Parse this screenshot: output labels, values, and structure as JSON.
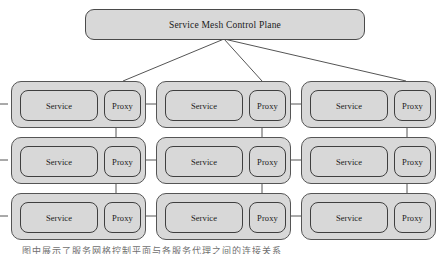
{
  "diagram": {
    "title": "Service Mesh Control Plane",
    "control_plane": {
      "label": "Service Mesh Control Plane"
    },
    "labels": {
      "service": "Service",
      "proxy": "Proxy"
    },
    "colors": {
      "box_fill": "#d8d8d8",
      "box_border": "#4a4a4a",
      "inner_border": "#3f3f3f",
      "wire": "#555555",
      "page_background": "#ffffff",
      "text": "#1a1a1a"
    },
    "grid": {
      "rows": 3,
      "columns": 3
    },
    "pods": [
      {
        "id": "pod-r1c1",
        "row": 1,
        "column": 1,
        "service_label": "Service",
        "proxy_label": "Proxy"
      },
      {
        "id": "pod-r1c2",
        "row": 1,
        "column": 2,
        "service_label": "Service",
        "proxy_label": "Proxy"
      },
      {
        "id": "pod-r1c3",
        "row": 1,
        "column": 3,
        "service_label": "Service",
        "proxy_label": "Proxy"
      },
      {
        "id": "pod-r2c1",
        "row": 2,
        "column": 1,
        "service_label": "Service",
        "proxy_label": "Proxy"
      },
      {
        "id": "pod-r2c2",
        "row": 2,
        "column": 2,
        "service_label": "Service",
        "proxy_label": "Proxy"
      },
      {
        "id": "pod-r2c3",
        "row": 2,
        "column": 3,
        "service_label": "Service",
        "proxy_label": "Proxy"
      },
      {
        "id": "pod-r3c1",
        "row": 3,
        "column": 1,
        "service_label": "Service",
        "proxy_label": "Proxy"
      },
      {
        "id": "pod-r3c2",
        "row": 3,
        "column": 2,
        "service_label": "Service",
        "proxy_label": "Proxy"
      },
      {
        "id": "pod-r3c3",
        "row": 3,
        "column": 3,
        "service_label": "Service",
        "proxy_label": "Proxy"
      }
    ],
    "connections": {
      "control_plane_to_proxies": [
        {
          "from": "control-plane",
          "to": "pod-r1c1-proxy"
        },
        {
          "from": "control-plane",
          "to": "pod-r1c2-proxy"
        },
        {
          "from": "control-plane",
          "to": "pod-r1c3-proxy"
        }
      ],
      "service_to_proxy": [
        {
          "from": "pod-r1c1-service",
          "to": "pod-r1c1-proxy"
        },
        {
          "from": "pod-r1c2-service",
          "to": "pod-r1c2-proxy"
        },
        {
          "from": "pod-r1c3-service",
          "to": "pod-r1c3-proxy"
        },
        {
          "from": "pod-r2c1-service",
          "to": "pod-r2c1-proxy"
        },
        {
          "from": "pod-r2c2-service",
          "to": "pod-r2c2-proxy"
        },
        {
          "from": "pod-r2c3-service",
          "to": "pod-r2c3-proxy"
        },
        {
          "from": "pod-r3c1-service",
          "to": "pod-r3c1-proxy"
        },
        {
          "from": "pod-r3c2-service",
          "to": "pod-r3c2-proxy"
        },
        {
          "from": "pod-r3c3-service",
          "to": "pod-r3c3-proxy"
        }
      ],
      "proxy_to_next_pod": [
        {
          "from": "pod-r1c1-proxy",
          "to": "pod-r1c2-service"
        },
        {
          "from": "pod-r1c2-proxy",
          "to": "pod-r1c3-service"
        },
        {
          "from": "pod-r2c1-proxy",
          "to": "pod-r2c2-service"
        },
        {
          "from": "pod-r2c2-proxy",
          "to": "pod-r2c3-service"
        },
        {
          "from": "pod-r3c1-proxy",
          "to": "pod-r3c2-service"
        },
        {
          "from": "pod-r3c2-proxy",
          "to": "pod-r3c3-service"
        }
      ],
      "proxy_column_vertical": [
        {
          "from": "pod-r1c1-proxy",
          "to": "pod-r2c1-proxy"
        },
        {
          "from": "pod-r2c1-proxy",
          "to": "pod-r3c1-proxy"
        },
        {
          "from": "pod-r1c2-proxy",
          "to": "pod-r2c2-proxy"
        },
        {
          "from": "pod-r2c2-proxy",
          "to": "pod-r3c2-proxy"
        },
        {
          "from": "pod-r1c3-proxy",
          "to": "pod-r2c3-proxy"
        },
        {
          "from": "pod-r2c3-proxy",
          "to": "pod-r3c3-proxy"
        }
      ]
    },
    "caption": "图中展示了服务网格控制平面与各服务代理之间的连接关系"
  }
}
